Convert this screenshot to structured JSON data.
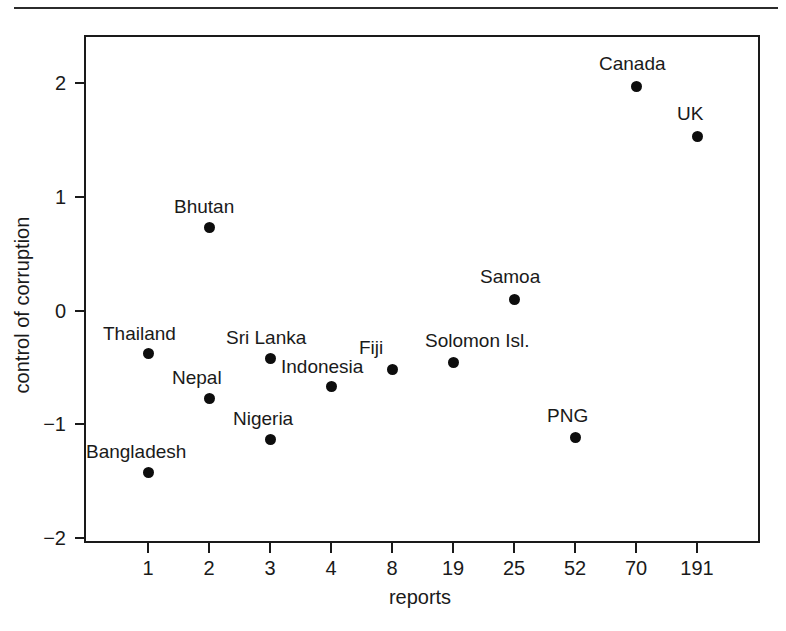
{
  "figure": {
    "background_color": "#ffffff",
    "ink_color": "#1a1a1a",
    "marker_color": "#0d0d0d"
  },
  "chart_data": {
    "type": "scatter",
    "title": "",
    "xlabel": "reports",
    "ylabel": "control of corruption",
    "x_tick_labels": [
      "1",
      "2",
      "3",
      "4",
      "8",
      "19",
      "25",
      "52",
      "70",
      "191"
    ],
    "x_axis_scale": "categorical-ordered",
    "y_tick_labels": [
      "2",
      "1",
      "0",
      "-1",
      "-2"
    ],
    "y_tick_values": [
      2,
      1,
      0,
      -1,
      -2
    ],
    "ylim": [
      -2,
      2.4
    ],
    "grid": false,
    "legend": "none",
    "points": [
      {
        "label": "Bangladesh",
        "x_category": "1",
        "x_index": 0,
        "y": -1.42,
        "label_dx": -62,
        "label_dy": -30
      },
      {
        "label": "Thailand",
        "x_category": "1",
        "x_index": 0,
        "y": -0.38,
        "label_dx": -45,
        "label_dy": -30
      },
      {
        "label": "Nepal",
        "x_category": "2",
        "x_index": 1,
        "y": -0.77,
        "label_dx": -37,
        "label_dy": -30
      },
      {
        "label": "Bhutan",
        "x_category": "2",
        "x_index": 1,
        "y": 0.73,
        "label_dx": -35,
        "label_dy": -30
      },
      {
        "label": "Nigeria",
        "x_category": "3",
        "x_index": 2,
        "y": -1.13,
        "label_dx": -37,
        "label_dy": -30
      },
      {
        "label": "Sri Lanka",
        "x_category": "3",
        "x_index": 2,
        "y": -0.42,
        "label_dx": -44,
        "label_dy": -30
      },
      {
        "label": "Indonesia",
        "x_category": "4",
        "x_index": 3,
        "y": -0.67,
        "label_dx": -50,
        "label_dy": -30
      },
      {
        "label": "Fiji",
        "x_category": "8",
        "x_index": 4,
        "y": -0.52,
        "label_dx": -33,
        "label_dy": -32
      },
      {
        "label": "Solomon Isl.",
        "x_category": "19",
        "x_index": 5,
        "y": -0.46,
        "label_dx": -28,
        "label_dy": -32
      },
      {
        "label": "Samoa",
        "x_category": "25",
        "x_index": 6,
        "y": 0.1,
        "label_dx": -34,
        "label_dy": -32
      },
      {
        "label": "PNG",
        "x_category": "52",
        "x_index": 7,
        "y": -1.12,
        "label_dx": -28,
        "label_dy": -32
      },
      {
        "label": "Canada",
        "x_category": "70",
        "x_index": 8,
        "y": 1.97,
        "label_dx": -37,
        "label_dy": -32
      },
      {
        "label": "UK",
        "x_category": "191",
        "x_index": 9,
        "y": 1.53,
        "label_dx": -20,
        "label_dy": -32
      }
    ]
  },
  "geometry": {
    "plot_left": 84,
    "plot_top": 35,
    "plot_right": 760,
    "plot_bottom": 543,
    "x_first_tick": 148,
    "x_tick_spacing": 61,
    "y_top_value": 2,
    "y_top_px": 83,
    "y_px_per_unit": 113.75
  }
}
